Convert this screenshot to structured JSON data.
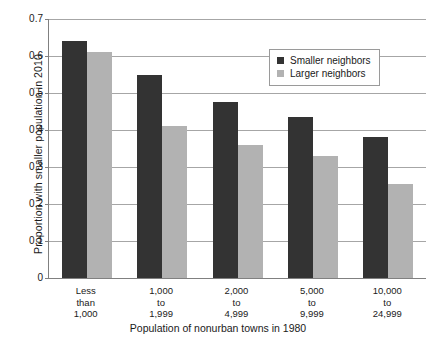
{
  "chart_data": {
    "type": "bar",
    "title": "",
    "xlabel": "Population of nonurban towns in 1980",
    "ylabel": "Proportion with smaller population in 2010",
    "categories": [
      "Less\nthan\n1,000",
      "1,000\nto\n1,999",
      "2,000\nto\n4,999",
      "5,000\nto\n9,999",
      "10,000\nto\n24,999"
    ],
    "category_lines": [
      [
        "Less",
        "than",
        "1,000"
      ],
      [
        "1,000",
        "to",
        "1,999"
      ],
      [
        "2,000",
        "to",
        "4,999"
      ],
      [
        "5,000",
        "to",
        "9,999"
      ],
      [
        "10,000",
        "to",
        "24,999"
      ]
    ],
    "series": [
      {
        "name": "Smaller neighbors",
        "color": "#333333",
        "values": [
          0.64,
          0.55,
          0.475,
          0.435,
          0.38
        ]
      },
      {
        "name": "Larger neighbors",
        "color": "#b2b2b2",
        "values": [
          0.61,
          0.41,
          0.36,
          0.33,
          0.255
        ]
      }
    ],
    "ylim": [
      0,
      0.7
    ],
    "ytick_values": [
      0,
      0.1,
      0.2,
      0.3,
      0.4,
      0.5,
      0.6,
      0.7
    ],
    "ytick_labels": [
      "0",
      "0.1",
      "0.2",
      "0.3",
      "0.4",
      "0.5",
      "0.6",
      "0.7"
    ],
    "grid": "horizontal",
    "legend_position": "top-right-inside",
    "background_color": "#ffffff",
    "axis_color": "#808080",
    "gridline_color": "#a6a6a6"
  },
  "legend": {
    "entries": [
      {
        "label": "Smaller neighbors"
      },
      {
        "label": "Larger neighbors"
      }
    ]
  }
}
